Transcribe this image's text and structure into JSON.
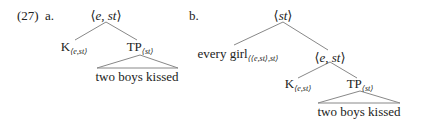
{
  "example_number": "(27)",
  "trees": [
    {
      "label": "a.",
      "root": {
        "open": "⟨",
        "type_a": "e",
        "sep": ", ",
        "type_b": "st",
        "close": "⟩"
      },
      "left": {
        "text": "K",
        "sub": "⟨e,st⟩"
      },
      "right": {
        "text": "TP",
        "sub": "⟨st⟩",
        "triangle_text": "two boys kissed"
      }
    },
    {
      "label": "b.",
      "root": {
        "open": "⟨",
        "type": "st",
        "close": "⟩"
      },
      "left": {
        "text": "every girl",
        "sub": "⟨⟨e,st⟩,st⟩"
      },
      "right": {
        "open": "⟨",
        "type_a": "e",
        "sep": ", ",
        "type_b": "st",
        "close": "⟩",
        "left": {
          "text": "K",
          "sub": "⟨e,st⟩"
        },
        "right": {
          "text": "TP",
          "sub": "⟨st⟩",
          "triangle_text": "two boys kissed"
        }
      }
    }
  ]
}
